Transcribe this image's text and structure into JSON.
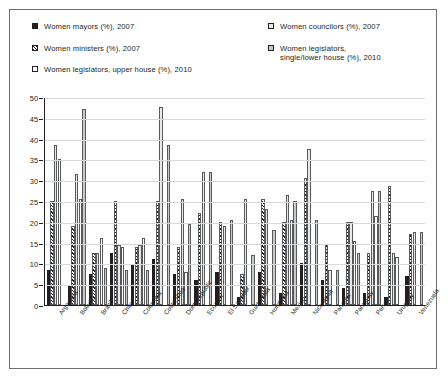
{
  "legend": {
    "left": [
      {
        "label": "Women mayors (%), 2007",
        "swatch": "solid-black-square-icon"
      },
      {
        "label": "Women ministers (%), 2007",
        "swatch": "diagonal-hatch-square-icon"
      },
      {
        "label": "Women legislators, upper house (%), 2010",
        "swatch": "white-square-icon"
      }
    ],
    "right": [
      {
        "label": "Women councilors (%), 2007",
        "swatch": "dotted-square-icon"
      },
      {
        "label": "Women legislators,\nsingle/lower house (%), 2010",
        "swatch": "gray-square-icon"
      }
    ]
  },
  "colors": {
    "mayors": "#231f20",
    "ministers": "#ffffff",
    "councilors": "#e9e9e9",
    "upper_house": "#ffffff",
    "lower_house": "#c8c9ca",
    "axis": "#231f20",
    "grid": "#d9d9d9",
    "frame": "#6d6e71"
  },
  "chart_data": {
    "type": "bar",
    "title": "",
    "xlabel": "",
    "ylabel": "",
    "ylim": [
      0,
      50
    ],
    "yticks": [
      0,
      5,
      10,
      15,
      20,
      25,
      30,
      35,
      40,
      45,
      50
    ],
    "grid": true,
    "legend_position": "top",
    "categories": [
      "Argentina",
      "Bolivia",
      "Brazil",
      "Chile",
      "Colombia",
      "Costa Rica",
      "Dom Republic",
      "Ecuador",
      "El Salvador",
      "Guatemala",
      "Honduras",
      "Mexico",
      "Nicaragua",
      "Panama",
      "Paraguay",
      "Peru",
      "Uruguay",
      "Venezuela"
    ],
    "series": [
      {
        "name": "Women mayors (%), 2007",
        "fill": "f-solid",
        "values": [
          8.5,
          4.5,
          7.5,
          12.5,
          9.5,
          11,
          7.5,
          6,
          8,
          2,
          8,
          3,
          10,
          6,
          4,
          3,
          2,
          7
        ]
      },
      {
        "name": "Women ministers (%), 2007",
        "fill": "f-hatch",
        "values": [
          25,
          19,
          12.5,
          25,
          14,
          25,
          14,
          22,
          20,
          7.5,
          25.5,
          20,
          30.5,
          14.5,
          20,
          12.5,
          28.5,
          17
        ]
      },
      {
        "name": "Women councilors (%), 2007",
        "fill": "f-dot",
        "values": [
          38.5,
          31.5,
          12.5,
          14.5,
          14.5,
          47.5,
          25.5,
          32,
          19,
          25.5,
          23,
          26.5,
          37.5,
          8.5,
          20,
          27.5,
          12.5,
          17.5
        ]
      },
      {
        "name": "Women legislators, upper house (%), 2010",
        "fill": "f-white",
        "values": [
          35,
          25.5,
          16,
          14,
          16,
          null,
          8,
          null,
          null,
          null,
          null,
          20.5,
          null,
          null,
          15.5,
          21.5,
          11.5,
          null
        ]
      },
      {
        "name": "Women legislators, single/lower house (%), 2010",
        "fill": "f-gray",
        "values": [
          null,
          47,
          9,
          8.5,
          8.5,
          38.5,
          19.5,
          32,
          20.5,
          12,
          18,
          25,
          20.5,
          8.5,
          12.5,
          27.5,
          null,
          17.5
        ]
      }
    ]
  }
}
